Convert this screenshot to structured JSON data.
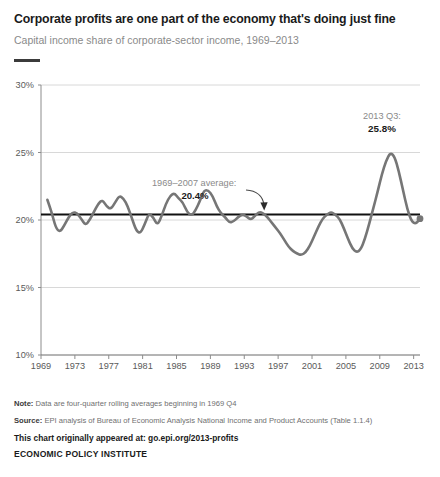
{
  "header": {
    "title": "Corporate profits are one part of the economy that's doing just fine",
    "subtitle": "Capital income share of corporate-sector income, 1969–2013"
  },
  "footnotes": {
    "note_label": "Note:",
    "note_text": " Data are four-quarter rolling averages beginning in 1969 Q4",
    "source_label": "Source:",
    "source_text": " EPI analysis of Bureau of Economic Analysis National Income and Product Accounts (Table 1.1.4)",
    "origin": "This chart originally appeared at: go.epi.org/2013-profits",
    "organization": "ECONOMIC POLICY INSTITUTE"
  },
  "colors": {
    "series_line": "#767676",
    "average_line": "#111111",
    "grid": "#d8d8d8",
    "axis": "#8c8c8c",
    "tick_label": "#5a5a5a",
    "annotation_gray": "#8a8a8a",
    "annotation_bold": "#1a1a1a",
    "title": "#1a1a1a",
    "subtitle": "#8a8a8a"
  },
  "chart_data": {
    "type": "line",
    "title": "Corporate profits are one part of the economy that's doing just fine",
    "subtitle": "Capital income share of corporate-sector income, 1969–2013",
    "xlabel": "",
    "ylabel": "",
    "xlim": [
      1969,
      2013.75
    ],
    "ylim": [
      10,
      30
    ],
    "ytick_labels": [
      "10%",
      "15%",
      "20%",
      "25%",
      "30%"
    ],
    "yticks": [
      10,
      15,
      20,
      25,
      30
    ],
    "xticks": [
      1969,
      1973,
      1977,
      1981,
      1985,
      1989,
      1993,
      1997,
      2001,
      2005,
      2009,
      2013
    ],
    "xtick_labels": [
      "1969",
      "1973",
      "1977",
      "1981",
      "1985",
      "1989",
      "1993",
      "1997",
      "2001",
      "2005",
      "2009",
      "2013"
    ],
    "grid": "horizontal",
    "legend": "none",
    "series": [
      {
        "name": "Capital income share of corporate-sector income",
        "units": "percent",
        "x": [
          1969.75,
          1970.25,
          1970.75,
          1971.25,
          1971.75,
          1972.25,
          1972.75,
          1973.25,
          1973.75,
          1974.25,
          1974.75,
          1975.25,
          1975.75,
          1976.25,
          1976.75,
          1977.25,
          1977.75,
          1978.25,
          1978.75,
          1979.25,
          1979.75,
          1980.25,
          1980.75,
          1981.25,
          1981.75,
          1982.25,
          1982.75,
          1983.25,
          1983.75,
          1984.25,
          1984.75,
          1985.25,
          1985.75,
          1986.25,
          1986.75,
          1987.25,
          1987.75,
          1988.25,
          1988.75,
          1989.25,
          1989.75,
          1990.25,
          1990.75,
          1991.25,
          1991.75,
          1992.25,
          1992.75,
          1993.25,
          1993.75,
          1994.25,
          1994.75,
          1995.25,
          1995.75,
          1996.25,
          1996.75,
          1997.25,
          1997.75,
          1998.25,
          1998.75,
          1999.25,
          1999.75,
          2000.25,
          2000.75,
          2001.25,
          2001.75,
          2002.25,
          2002.75,
          2003.25,
          2003.75,
          2004.25,
          2004.75,
          2005.25,
          2005.75,
          2006.25,
          2006.75,
          2007.25,
          2007.75,
          2008.25,
          2008.75,
          2009.25,
          2009.75,
          2010.25,
          2010.75,
          2011.25,
          2011.75,
          2012.25,
          2012.75,
          2013.25,
          2013.75
        ],
        "y": [
          21.5,
          20.6,
          19.4,
          19.1,
          19.6,
          20.2,
          20.6,
          20.5,
          20.1,
          19.6,
          20.0,
          20.6,
          21.2,
          21.5,
          21.0,
          20.8,
          21.3,
          21.8,
          21.6,
          21.0,
          20.1,
          19.2,
          19.0,
          19.7,
          20.5,
          20.2,
          19.6,
          20.3,
          21.2,
          21.8,
          22.0,
          21.6,
          21.3,
          20.6,
          20.3,
          20.7,
          21.4,
          22.2,
          22.2,
          21.8,
          21.0,
          20.5,
          20.2,
          19.8,
          19.9,
          20.2,
          20.4,
          20.3,
          20.0,
          20.3,
          20.6,
          20.5,
          20.2,
          19.8,
          19.4,
          19.0,
          18.5,
          18.0,
          17.7,
          17.5,
          17.4,
          17.6,
          18.1,
          18.8,
          19.5,
          20.1,
          20.4,
          20.6,
          20.4,
          20.1,
          19.4,
          18.6,
          17.9,
          17.6,
          17.8,
          18.6,
          19.7,
          20.9,
          22.1,
          23.4,
          24.4,
          25.0,
          24.7,
          23.6,
          22.2,
          20.8,
          19.9,
          19.7,
          20.1
        ]
      }
    ],
    "reference_line": {
      "label": "1969–2007 average:",
      "value_label": "20.4%",
      "value": 20.4,
      "x_start": 1969,
      "x_end": 2013.75
    },
    "endpoint_annotation": {
      "label": "2013 Q3:",
      "value_label": "25.8%",
      "value": 25.8,
      "x": 2013.75
    }
  }
}
